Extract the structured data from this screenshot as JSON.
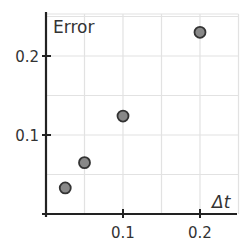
{
  "chart_data": {
    "type": "scatter",
    "title": "",
    "xlabel": "Δt",
    "ylabel": "Error",
    "x": [
      0.025,
      0.05,
      0.1,
      0.2
    ],
    "y": [
      0.033,
      0.065,
      0.124,
      0.23
    ],
    "xlim": [
      0,
      0.25
    ],
    "ylim": [
      0,
      0.25
    ],
    "xticks": [
      0.1,
      0.2
    ],
    "xtick_labels": [
      "0.1",
      "0.2"
    ],
    "yticks": [
      0.1,
      0.2
    ],
    "ytick_labels": [
      "0.1",
      "0.2"
    ],
    "grid": true,
    "grid_step": 0.05,
    "marker_color": "#888888",
    "marker_edge_color": "#333333",
    "legend": null
  }
}
